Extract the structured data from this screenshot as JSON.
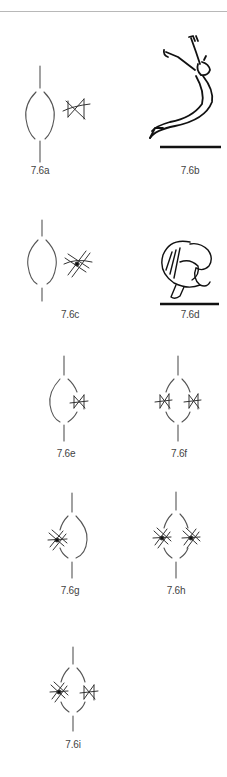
{
  "page": {
    "background": "#ffffff",
    "rule_color": "#b8b8b8"
  },
  "figures": [
    {
      "id": "7.6a",
      "label": "7.6a",
      "kind": "symbol",
      "description": "vertical line, closed oval arc (left solid, right solid) with single cross-hatched sign to the right"
    },
    {
      "id": "7.6b",
      "label": "7.6b",
      "kind": "illustration",
      "description": "leaping figure arched backward with arms raised, floor line below"
    },
    {
      "id": "7.6c",
      "label": "7.6c",
      "kind": "symbol",
      "description": "vertical line, oval arc with multi-stroke asterisk sign to the right"
    },
    {
      "id": "7.6d",
      "label": "7.6d",
      "kind": "illustration",
      "description": "curled-up crouching figure, floor line below"
    },
    {
      "id": "7.6e",
      "label": "7.6e",
      "kind": "symbol",
      "description": "oval with right side broken, single small sign on right"
    },
    {
      "id": "7.6f",
      "label": "7.6f",
      "kind": "symbol",
      "description": "oval broken on both sides, small sign on each side"
    },
    {
      "id": "7.6g",
      "label": "7.6g",
      "kind": "symbol",
      "description": "oval broken on left, asterisk sign on left"
    },
    {
      "id": "7.6h",
      "label": "7.6h",
      "kind": "symbol",
      "description": "oval broken on both sides, asterisk sign on each side"
    },
    {
      "id": "7.6i",
      "label": "7.6i",
      "kind": "symbol",
      "description": "oval broken on both sides, asterisk on left, small sign on right"
    }
  ]
}
